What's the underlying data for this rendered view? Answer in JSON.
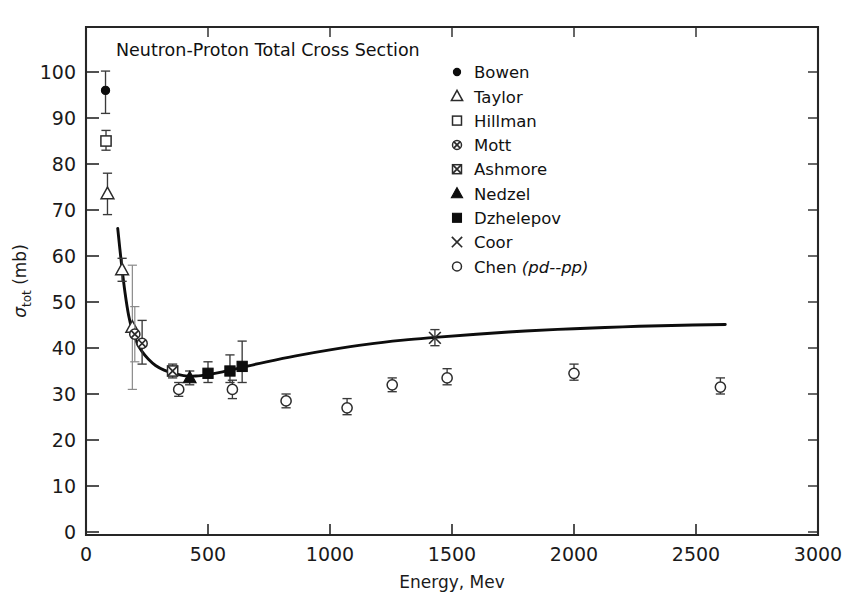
{
  "chart_data": {
    "type": "scatter",
    "title": "Neutron-Proton Total Cross Section",
    "xlabel": "Energy, Mev",
    "ylabel": "σtot (mb)",
    "ylabel_main": "σ",
    "ylabel_sub": "tot",
    "ylabel_unit": " (mb)",
    "xlim": [
      0,
      3000
    ],
    "ylim": [
      0,
      105
    ],
    "xticks": [
      0,
      500,
      1000,
      1500,
      2000,
      2500,
      3000
    ],
    "xticklabels": [
      "0",
      "500",
      "1000",
      "1500",
      "2000",
      "2500",
      "3000"
    ],
    "yticks": [
      0,
      10,
      20,
      30,
      40,
      50,
      60,
      70,
      80,
      90,
      100
    ],
    "yticklabels": [
      "0",
      "10",
      "20",
      "30",
      "40",
      "50",
      "60",
      "70",
      "80",
      "90",
      "100"
    ],
    "grid": false,
    "legend_position": "top-right-inside",
    "series": [
      {
        "name": "Bowen",
        "marker": "filled-circle",
        "points": [
          {
            "x": 80,
            "y": 96.0,
            "yerr_low": 91.0,
            "yerr_high": 100.2
          }
        ]
      },
      {
        "name": "Taylor",
        "marker": "open-triangle",
        "points": [
          {
            "x": 88,
            "y": 73.5,
            "yerr_low": 69.0,
            "yerr_high": 78.0
          },
          {
            "x": 148,
            "y": 57.0,
            "yerr_low": 54.5,
            "yerr_high": 59.5
          },
          {
            "x": 190,
            "y": 44.5,
            "yerr_low": 31.0,
            "yerr_high": 58.0
          }
        ]
      },
      {
        "name": "Hillman",
        "marker": "open-square",
        "points": [
          {
            "x": 82,
            "y": 85.0,
            "yerr_low": 83.0,
            "yerr_high": 87.3
          }
        ]
      },
      {
        "name": "Mott",
        "marker": "crossed-circle",
        "points": [
          {
            "x": 200,
            "y": 43.0,
            "yerr_low": 37.0,
            "yerr_high": 49.0
          },
          {
            "x": 230,
            "y": 41.0,
            "yerr_low": 36.5,
            "yerr_high": 46.0
          }
        ]
      },
      {
        "name": "Ashmore",
        "marker": "crossed-square",
        "points": [
          {
            "x": 355,
            "y": 35.0,
            "yerr_low": 33.5,
            "yerr_high": 36.5
          }
        ]
      },
      {
        "name": "Nedzel",
        "marker": "filled-triangle",
        "points": [
          {
            "x": 425,
            "y": 33.5,
            "yerr_low": 32.0,
            "yerr_high": 35.0
          }
        ]
      },
      {
        "name": "Dzhelepov",
        "marker": "filled-square",
        "points": [
          {
            "x": 500,
            "y": 34.5,
            "yerr_low": 32.5,
            "yerr_high": 37.0
          },
          {
            "x": 590,
            "y": 35.0,
            "yerr_low": 32.5,
            "yerr_high": 38.5
          },
          {
            "x": 640,
            "y": 36.0,
            "yerr_low": 32.5,
            "yerr_high": 41.5
          }
        ]
      },
      {
        "name": "Coor",
        "marker": "cross",
        "points": [
          {
            "x": 1430,
            "y": 42.2,
            "yerr_low": 40.5,
            "yerr_high": 44.0
          }
        ]
      },
      {
        "name": "Chen (pd--pp)",
        "marker": "open-circle",
        "legend_plain": "Chen ",
        "legend_italic": "(pd--pp)",
        "points": [
          {
            "x": 380,
            "y": 31.0,
            "yerr_low": 29.5,
            "yerr_high": 32.5
          },
          {
            "x": 600,
            "y": 31.0,
            "yerr_low": 29.0,
            "yerr_high": 33.0
          },
          {
            "x": 820,
            "y": 28.5,
            "yerr_low": 27.0,
            "yerr_high": 30.0
          },
          {
            "x": 1070,
            "y": 27.0,
            "yerr_low": 25.5,
            "yerr_high": 29.0
          },
          {
            "x": 1255,
            "y": 32.0,
            "yerr_low": 30.5,
            "yerr_high": 33.5
          },
          {
            "x": 1480,
            "y": 33.5,
            "yerr_low": 32.0,
            "yerr_high": 35.5
          },
          {
            "x": 2000,
            "y": 34.5,
            "yerr_low": 33.0,
            "yerr_high": 36.5
          },
          {
            "x": 2600,
            "y": 31.5,
            "yerr_low": 30.0,
            "yerr_high": 33.5
          }
        ]
      }
    ],
    "fit_curve": {
      "name": "fitted-cross-section-curve",
      "points": [
        [
          130,
          66.0
        ],
        [
          145,
          58.5
        ],
        [
          160,
          52.0
        ],
        [
          175,
          47.0
        ],
        [
          190,
          43.8
        ],
        [
          210,
          41.0
        ],
        [
          230,
          39.2
        ],
        [
          255,
          37.6
        ],
        [
          285,
          36.2
        ],
        [
          320,
          35.2
        ],
        [
          360,
          34.5
        ],
        [
          400,
          34.0
        ],
        [
          450,
          33.9
        ],
        [
          500,
          34.2
        ],
        [
          560,
          34.8
        ],
        [
          640,
          35.8
        ],
        [
          740,
          37.0
        ],
        [
          860,
          38.3
        ],
        [
          1000,
          39.6
        ],
        [
          1150,
          40.8
        ],
        [
          1300,
          41.7
        ],
        [
          1430,
          42.3
        ],
        [
          1600,
          43.0
        ],
        [
          1800,
          43.7
        ],
        [
          2000,
          44.2
        ],
        [
          2200,
          44.6
        ],
        [
          2400,
          44.9
        ],
        [
          2620,
          45.1
        ]
      ]
    }
  },
  "legend": {
    "entries": [
      {
        "label": "Bowen",
        "marker": "filled-circle"
      },
      {
        "label": "Taylor",
        "marker": "open-triangle"
      },
      {
        "label": "Hillman",
        "marker": "open-square"
      },
      {
        "label": "Mott",
        "marker": "crossed-circle"
      },
      {
        "label": "Ashmore",
        "marker": "crossed-square"
      },
      {
        "label": "Nedzel",
        "marker": "filled-triangle"
      },
      {
        "label": "Dzhelepov",
        "marker": "filled-square"
      },
      {
        "label": "Coor",
        "marker": "cross"
      },
      {
        "label": "Chen (pd--pp)",
        "marker": "open-circle"
      }
    ]
  },
  "colors": {
    "axis": "#262626",
    "curve": "#0d0d0d",
    "marker_stroke": "#2b2b2b",
    "marker_fill_open": "#ffffff",
    "marker_fill_closed": "#0d0d0d",
    "errorbar": "#3a3a3a",
    "background": "#ffffff",
    "text": "#1a1a1a"
  }
}
